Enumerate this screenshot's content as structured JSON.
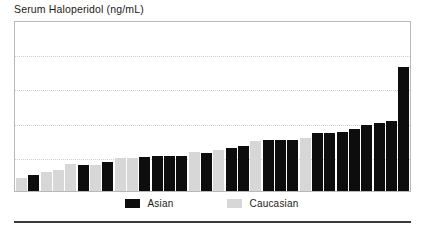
{
  "chart_data": {
    "type": "bar",
    "title": "Serum Haloperidol (ng/mL)",
    "xlabel": "",
    "ylabel": "Serum Haloperidol (ng/mL)",
    "ylim": [
      0,
      35
    ],
    "grid": true,
    "gridlines": [
      7,
      14,
      21,
      28
    ],
    "legend_position": "bottom-center",
    "sorted": "ascending",
    "categories": [
      "1",
      "2",
      "3",
      "4",
      "5",
      "6",
      "7",
      "8",
      "9",
      "10",
      "11",
      "12",
      "13",
      "14",
      "15",
      "16",
      "17",
      "18",
      "19",
      "20",
      "21",
      "22",
      "23",
      "24",
      "25",
      "26",
      "27",
      "28",
      "29",
      "30",
      "31",
      "32"
    ],
    "values": [
      2.6,
      3.2,
      3.8,
      4.4,
      5.6,
      5.4,
      5.4,
      5.9,
      6.8,
      6.8,
      7.0,
      7.2,
      7.2,
      7.2,
      8.0,
      7.7,
      8.4,
      8.9,
      9.2,
      10.2,
      10.4,
      10.4,
      10.4,
      10.8,
      11.8,
      11.9,
      12.0,
      12.6,
      13.5,
      14.0,
      14.4,
      25.4
    ],
    "groups": [
      "Caucasian",
      "Asian",
      "Caucasian",
      "Caucasian",
      "Caucasian",
      "Asian",
      "Caucasian",
      "Asian",
      "Caucasian",
      "Caucasian",
      "Asian",
      "Asian",
      "Asian",
      "Asian",
      "Caucasian",
      "Asian",
      "Caucasian",
      "Asian",
      "Asian",
      "Caucasian",
      "Asian",
      "Asian",
      "Asian",
      "Caucasian",
      "Asian",
      "Asian",
      "Asian",
      "Asian",
      "Asian",
      "Asian",
      "Asian",
      "Asian"
    ],
    "series": [
      {
        "name": "Asian",
        "color": "#0d0d0d"
      },
      {
        "name": "Caucasian",
        "color": "#d7d7d7"
      }
    ]
  },
  "legend": {
    "entries": [
      {
        "label": "Asian",
        "color": "#0d0d0d"
      },
      {
        "label": "Caucasian",
        "color": "#d7d7d7"
      }
    ]
  },
  "colors": {
    "asian": "#0d0d0d",
    "caucasian": "#d7d7d7",
    "gridline": "#cfcfcf",
    "frame": "#b9b9b9",
    "rule": "#3a3a3a",
    "text": "#1a1a1a"
  }
}
